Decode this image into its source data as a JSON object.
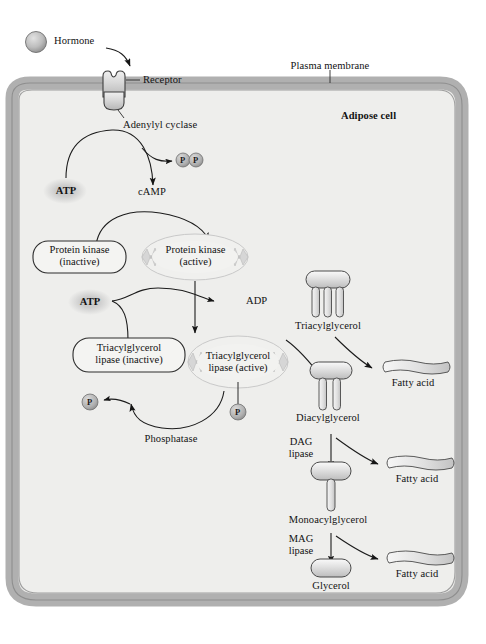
{
  "figure": {
    "cell_label": "Adipose cell",
    "membrane_label": "Plasma membrane"
  },
  "colors": {
    "membrane": "#b3b3b3",
    "membrane_dark": "#9a9a9a",
    "cytosol": "#eeeeec",
    "protein_fill": "#d5d5d5",
    "protein_stroke": "#4a4a4a",
    "stroke": "#1c1c1c",
    "text": "#121212",
    "halo": "#d0d0d0"
  },
  "extracellular": {
    "hormone": "Hormone",
    "receptor": "Receptor",
    "adenylyl_cyclase": "Adenylyl cyclase"
  },
  "camp_branch": {
    "atp": "ATP",
    "pyrophosphate": "P",
    "camp": "cAMP",
    "protein_kinase_inactive_line1": "Protein kinase",
    "protein_kinase_inactive_line2": "(inactive)",
    "protein_kinase_active_line1": "Protein kinase",
    "protein_kinase_active_line2": "(active)"
  },
  "lipase_cycle": {
    "atp": "ATP",
    "adp": "ADP",
    "lipase_inactive_line1": "Triacylglycerol",
    "lipase_inactive_line2": "lipase (inactive)",
    "lipase_active_line1": "Triacylglycerol",
    "lipase_active_line2": "lipase (active)",
    "phosphatase": "Phosphatase",
    "phosphate_released": "P",
    "phosphate_attached": "P"
  },
  "lipolysis_chain": {
    "steps": [
      {
        "name": "Triacylglycerol",
        "tails": 3
      },
      {
        "name": "Diacylglycerol",
        "tails": 2
      },
      {
        "name": "Monoacylglycerol",
        "tails": 1
      },
      {
        "name": "Glycerol",
        "tails": 0
      }
    ],
    "enzymes": [
      {
        "line1": "DAG",
        "line2": "lipase"
      },
      {
        "line1": "MAG",
        "line2": "lipase"
      }
    ],
    "products": [
      {
        "name": "Fatty acid"
      },
      {
        "name": "Fatty acid"
      },
      {
        "name": "Fatty acid"
      }
    ]
  }
}
